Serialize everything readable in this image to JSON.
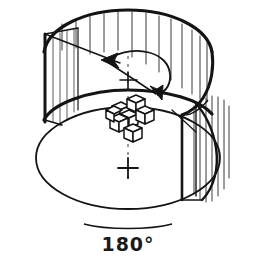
{
  "figure": {
    "medium": "hand-drawn line illustration",
    "background_color": "#ffffff",
    "ink_color": "#141414",
    "hatch_color": "#3a3a3a",
    "caption": "180°",
    "caption_position": "below-cylinder-center",
    "annotations": {
      "rotation_arrow": "double-headed curved arrow indicating 180 degree rotation",
      "axis": "dashed vertical rotation axis with cross tick marks",
      "object": "3D polycube plus-shaped solid at center of turntable",
      "cutaway": "cylinder wall cut away at front-left, hatched interior walls"
    },
    "components": {
      "cylinder_label": "turntable cylinder",
      "top_rim_label": "top rim ellipse",
      "inner_rim_label": "inner floor rim arc",
      "base_label": "base ellipse",
      "cut_face_left_label": "left radial cut face",
      "cut_face_right_label": "right radial cut face",
      "hatching_label": "vertical wall hatching"
    },
    "geometry": {
      "canvas_width": 253,
      "canvas_height": 262,
      "cylinder_center_x": 128,
      "top_ellipse_cy": 46,
      "top_ellipse_rx": 92,
      "top_ellipse_ry": 36,
      "base_ellipse_cy": 158,
      "base_ellipse_rx": 92,
      "base_ellipse_ry": 52,
      "axis_x": 128,
      "cross_top_y": 80,
      "cross_bottom_y": 168
    },
    "hatch_lines_top": [
      {
        "x": 62,
        "y1": 22,
        "y2": 48
      },
      {
        "x": 76,
        "y1": 18,
        "y2": 46
      },
      {
        "x": 90,
        "y1": 15,
        "y2": 52
      },
      {
        "x": 104,
        "y1": 13,
        "y2": 50
      },
      {
        "x": 118,
        "y1": 12,
        "y2": 48
      },
      {
        "x": 132,
        "y1": 12,
        "y2": 55
      },
      {
        "x": 146,
        "y1": 13,
        "y2": 62
      },
      {
        "x": 160,
        "y1": 15,
        "y2": 70
      },
      {
        "x": 172,
        "y1": 18,
        "y2": 78
      },
      {
        "x": 184,
        "y1": 23,
        "y2": 86
      },
      {
        "x": 194,
        "y1": 28,
        "y2": 92
      },
      {
        "x": 203,
        "y1": 34,
        "y2": 96
      }
    ],
    "hatch_lines_right": [
      {
        "x": 196,
        "y1": 104,
        "y2": 196
      },
      {
        "x": 203,
        "y1": 100,
        "y2": 200
      },
      {
        "x": 210,
        "y1": 97,
        "y2": 201
      },
      {
        "x": 216,
        "y1": 96,
        "y2": 198
      },
      {
        "x": 222,
        "y1": 98,
        "y2": 192
      },
      {
        "x": 228,
        "y1": 104,
        "y2": 182
      }
    ],
    "hatch_lines_left_face": [
      {
        "x": 52,
        "y1": 36,
        "y2": 122
      },
      {
        "x": 59,
        "y1": 33,
        "y2": 126
      },
      {
        "x": 66,
        "y1": 31,
        "y2": 118
      }
    ]
  }
}
